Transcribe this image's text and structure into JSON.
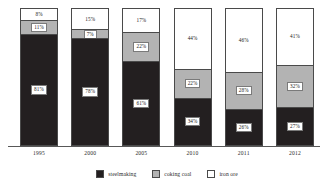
{
  "chart_data": {
    "type": "bar",
    "stacked": true,
    "stack_mode": "percent",
    "title": "",
    "subtitle": "",
    "xlabel": "",
    "ylabel": "",
    "ylim": [
      0,
      100
    ],
    "grid": false,
    "legend_position": "bottom",
    "categories": [
      "1995",
      "2000",
      "2005",
      "2010",
      "2011",
      "2012"
    ],
    "series": [
      {
        "name": "steelmaking",
        "color": "#231f20",
        "values": [
          81,
          78,
          61,
          34,
          26,
          27
        ],
        "labels": [
          "81%",
          "78%",
          "61%",
          "34%",
          "26%",
          "27%"
        ]
      },
      {
        "name": "coking coal",
        "color": "#b3b3b3",
        "values": [
          11,
          7,
          22,
          22,
          28,
          32
        ],
        "labels": [
          "11%",
          "7%",
          "22%",
          "22%",
          "28%",
          "32%"
        ]
      },
      {
        "name": "iron ore",
        "color": "#ffffff",
        "values": [
          8,
          15,
          17,
          44,
          46,
          41
        ],
        "labels": [
          "8%",
          "15%",
          "17%",
          "44%",
          "46%",
          "41%"
        ]
      }
    ]
  },
  "bars": [
    {
      "year": "1995",
      "iron": {
        "pct": 8,
        "label": "8%"
      },
      "coking": {
        "pct": 11,
        "label": "11%"
      },
      "steel": {
        "pct": 81,
        "label": "81%"
      }
    },
    {
      "year": "2000",
      "iron": {
        "pct": 15,
        "label": "15%"
      },
      "coking": {
        "pct": 7,
        "label": "7%"
      },
      "steel": {
        "pct": 78,
        "label": "78%"
      }
    },
    {
      "year": "2005",
      "iron": {
        "pct": 17,
        "label": "17%"
      },
      "coking": {
        "pct": 22,
        "label": "22%"
      },
      "steel": {
        "pct": 61,
        "label": "61%"
      }
    },
    {
      "year": "2010",
      "iron": {
        "pct": 44,
        "label": "44%"
      },
      "coking": {
        "pct": 22,
        "label": "22%"
      },
      "steel": {
        "pct": 34,
        "label": "34%"
      }
    },
    {
      "year": "2011",
      "iron": {
        "pct": 46,
        "label": "46%"
      },
      "coking": {
        "pct": 28,
        "label": "28%"
      },
      "steel": {
        "pct": 26,
        "label": "26%"
      }
    },
    {
      "year": "2012",
      "iron": {
        "pct": 41,
        "label": "41%"
      },
      "coking": {
        "pct": 32,
        "label": "32%"
      },
      "steel": {
        "pct": 27,
        "label": "27%"
      }
    }
  ],
  "legend": {
    "items": [
      {
        "label": "steelmaking",
        "color": "#231f20"
      },
      {
        "label": "coking coal",
        "color": "#b3b3b3"
      },
      {
        "label": "iron ore",
        "color": "#ffffff"
      }
    ]
  }
}
